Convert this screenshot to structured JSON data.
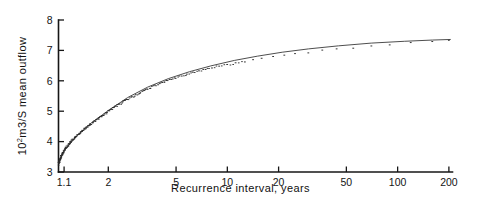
{
  "figure": {
    "background_color": "#ffffff",
    "ink_color": "#161616",
    "data_color": "#2b2b2b"
  },
  "chart_data": {
    "type": "scatter",
    "title": "",
    "subtitle": "",
    "xlabel": "Recurrence interval, years",
    "ylabel": "10²m3/S   mean outflow",
    "ylabel_parts": {
      "base": "10",
      "exponent": "2",
      "rest": "m3/S   mean outflow"
    },
    "xscale": "log",
    "yscale": "linear",
    "xlim": [
      1.02,
      210
    ],
    "ylim": [
      3,
      8
    ],
    "grid": false,
    "legend": null,
    "xticks": [
      1.1,
      2,
      5,
      10,
      20,
      50,
      100,
      200
    ],
    "xticklabels": [
      "1.1",
      "2",
      "5",
      "10",
      "20",
      "50",
      "100",
      "200"
    ],
    "yticks": [
      3,
      4,
      5,
      6,
      7,
      8
    ],
    "yticklabels": [
      "3",
      "4",
      "5",
      "6",
      "7",
      "8"
    ],
    "series": [
      {
        "name": "Observed annual mean outflow",
        "marker": "dot",
        "x": [
          1.025,
          1.03,
          1.035,
          1.04,
          1.045,
          1.05,
          1.055,
          1.06,
          1.07,
          1.075,
          1.085,
          1.09,
          1.1,
          1.11,
          1.12,
          1.13,
          1.145,
          1.16,
          1.175,
          1.19,
          1.205,
          1.22,
          1.24,
          1.26,
          1.28,
          1.3,
          1.32,
          1.35,
          1.37,
          1.4,
          1.43,
          1.46,
          1.5,
          1.53,
          1.57,
          1.61,
          1.65,
          1.7,
          1.75,
          1.8,
          1.85,
          1.9,
          1.96,
          2.02,
          2.08,
          2.15,
          2.22,
          2.3,
          2.4,
          2.5,
          2.6,
          2.72,
          2.85,
          3.0,
          3.15,
          3.3,
          3.5,
          3.7,
          3.9,
          4.15,
          4.4,
          4.7,
          5.0,
          5.4,
          5.8,
          6.3,
          6.8,
          7.4,
          8.1,
          9.0,
          10.0,
          11.2,
          12.6,
          14.2,
          16.0,
          18.5,
          21.5,
          25.0,
          30.0,
          36.0,
          44.0,
          55.0,
          70.0,
          90.0,
          120.0,
          160.0,
          200.0
        ],
        "y": [
          3.3,
          3.33,
          3.36,
          3.4,
          3.43,
          3.46,
          3.49,
          3.52,
          3.56,
          3.59,
          3.63,
          3.66,
          3.7,
          3.74,
          3.77,
          3.8,
          3.84,
          3.88,
          3.92,
          3.96,
          3.99,
          4.03,
          4.07,
          4.11,
          4.15,
          4.18,
          4.22,
          4.27,
          4.3,
          4.35,
          4.39,
          4.43,
          4.48,
          4.52,
          4.57,
          4.61,
          4.66,
          4.71,
          4.76,
          4.81,
          4.86,
          4.9,
          4.96,
          5.01,
          5.06,
          5.11,
          5.17,
          5.22,
          5.28,
          5.34,
          5.39,
          5.45,
          5.51,
          5.58,
          5.64,
          5.7,
          5.76,
          5.82,
          5.87,
          5.93,
          5.99,
          6.05,
          6.1,
          6.16,
          6.21,
          6.27,
          6.32,
          6.37,
          6.42,
          6.48,
          6.53,
          6.58,
          6.63,
          6.68,
          6.73,
          6.78,
          6.83,
          6.88,
          6.94,
          6.99,
          7.04,
          7.09,
          7.14,
          7.19,
          7.24,
          7.28,
          7.32
        ]
      }
    ],
    "fit_line": {
      "name": "Fitted frequency curve",
      "x": [
        1.02,
        1.1,
        1.3,
        1.6,
        2.0,
        2.6,
        3.4,
        4.5,
        6.0,
        8.0,
        11.0,
        15.0,
        21.0,
        30.0,
        45.0,
        70.0,
        110.0,
        160.0,
        205.0
      ],
      "y": [
        3.28,
        3.7,
        4.18,
        4.63,
        5.02,
        5.45,
        5.79,
        6.07,
        6.3,
        6.49,
        6.67,
        6.81,
        6.94,
        7.05,
        7.15,
        7.24,
        7.3,
        7.34,
        7.36
      ]
    },
    "annotations": []
  }
}
